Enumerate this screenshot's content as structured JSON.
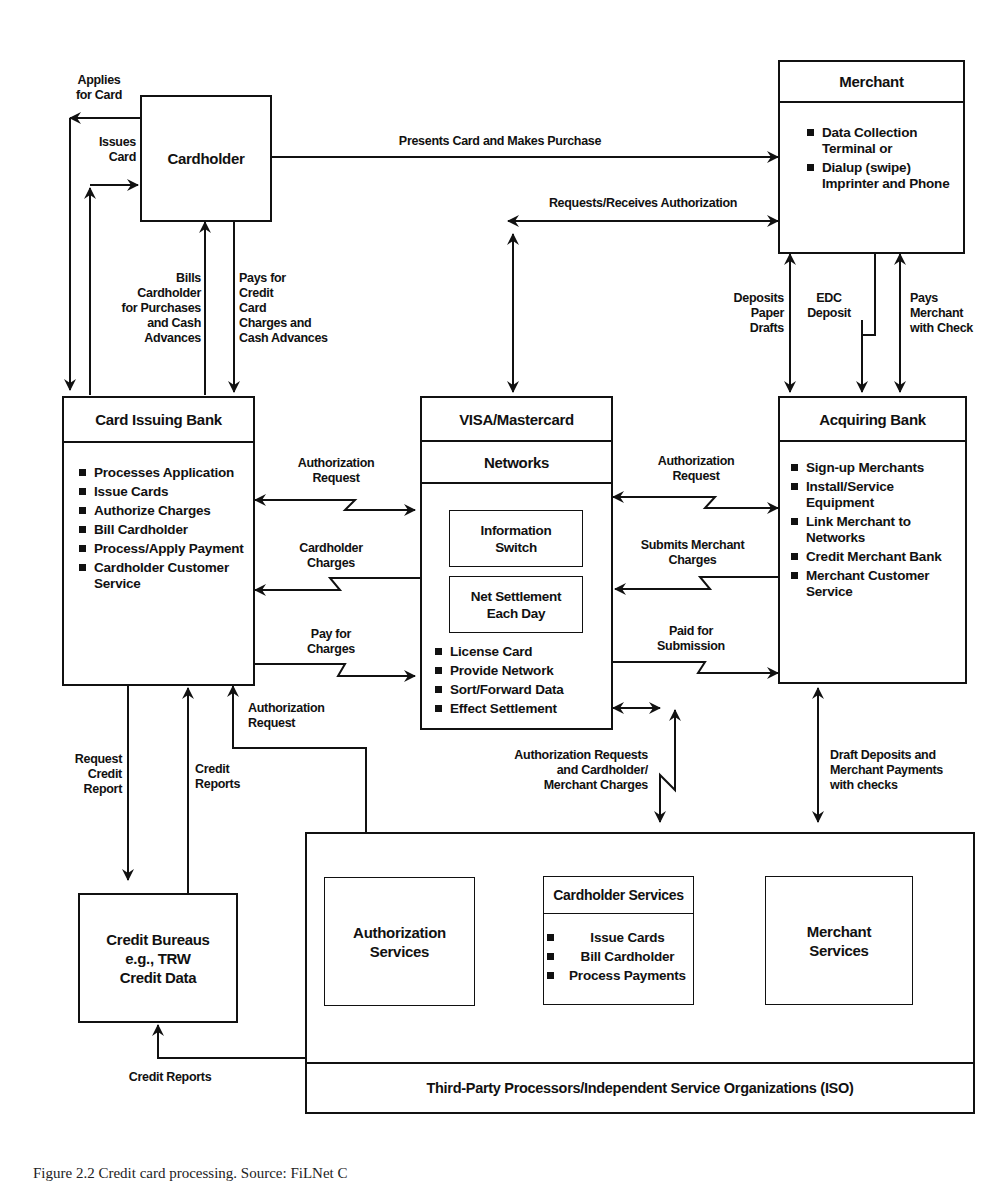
{
  "diagram": {
    "type": "flow-diagram",
    "subject": "Credit card processing"
  },
  "nodes": {
    "cardholder": {
      "title": "Cardholder"
    },
    "merchant": {
      "title": "Merchant",
      "items": [
        "Data Collection Terminal or",
        "Dialup (swipe) Imprinter and Phone"
      ]
    },
    "card_issuing_bank": {
      "title": "Card Issuing Bank",
      "items": [
        "Processes Application",
        "Issue Cards",
        "Authorize Charges",
        "Bill Cardholder",
        "Process/Apply Payment",
        "Cardholder Customer Service"
      ]
    },
    "networks": {
      "title": "VISA/Mastercard",
      "subtitle": "Networks",
      "sub_boxes": [
        "Information\nSwitch",
        "Net Settlement\nEach Day"
      ],
      "items": [
        "License Card",
        "Provide Network",
        "Sort/Forward Data",
        "Effect Settlement"
      ]
    },
    "acquiring_bank": {
      "title": "Acquiring Bank",
      "items": [
        "Sign-up Merchants",
        "Install/Service Equipment",
        "Link Merchant to Networks",
        "Credit Merchant Bank",
        "Merchant Customer Service"
      ]
    },
    "credit_bureau": {
      "title": "Credit Bureaus\ne.g., TRW\nCredit Data"
    },
    "iso": {
      "footer": "Third-Party Processors/Independent Service Organizations (ISO)",
      "authorization_services": "Authorization\nServices",
      "cardholder_services": {
        "title": "Cardholder Services",
        "items": [
          "Issue Cards",
          "Bill Cardholder",
          "Process Payments"
        ]
      },
      "merchant_services": "Merchant\nServices"
    }
  },
  "edges": {
    "applies_for_card": "Applies\nfor Card",
    "issues_card": "Issues\nCard",
    "presents_card": "Presents Card and Makes Purchase",
    "requests_receives_auth": "Requests/Receives Authorization",
    "bills_cardholder": "Bills\nCardholder\nfor Purchases\nand Cash\nAdvances",
    "pays_for_credit": "Pays for\nCredit\nCard\nCharges and\nCash Advances",
    "deposits_paper_drafts": "Deposits\nPaper\nDrafts",
    "edc_deposit": "EDC\nDeposit",
    "pays_merchant_check": "Pays\nMerchant\nwith Check",
    "auth_request_left": "Authorization\nRequest",
    "cardholder_charges": "Cardholder\nCharges",
    "pay_for_charges": "Pay for\nCharges",
    "auth_request_right": "Authorization\nRequest",
    "submits_merchant_charges": "Submits Merchant\nCharges",
    "paid_for_submission": "Paid for\nSubmission",
    "auth_request_iso": "Authorization\nRequest",
    "request_credit_report": "Request\nCredit\nReport",
    "credit_reports_up": "Credit\nReports",
    "auth_requests_charges": "Authorization Requests\nand Cardholder/\nMerchant Charges",
    "draft_deposits": "Draft Deposits and\nMerchant Payments\nwith checks",
    "credit_reports_bottom": "Credit Reports"
  },
  "caption": "Figure 2.2 Credit card processing. Source: FiLNet C"
}
